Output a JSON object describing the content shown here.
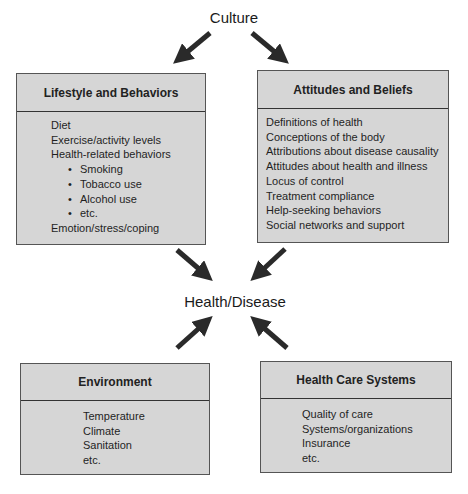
{
  "diagram": {
    "top_node": "Culture",
    "center_node": "Health/Disease",
    "boxes": {
      "lifestyle": {
        "title": "Lifestyle and Behaviors",
        "items": [
          {
            "text": "Diet",
            "bullet": false
          },
          {
            "text": "Exercise/activity levels",
            "bullet": false
          },
          {
            "text": "Health-related behaviors",
            "bullet": false
          },
          {
            "text": "Smoking",
            "bullet": true
          },
          {
            "text": "Tobacco use",
            "bullet": true
          },
          {
            "text": "Alcohol use",
            "bullet": true
          },
          {
            "text": "etc.",
            "bullet": true
          },
          {
            "text": "Emotion/stress/coping",
            "bullet": false
          }
        ]
      },
      "attitudes": {
        "title": "Attitudes and Beliefs",
        "items": [
          "Definitions of health",
          "Conceptions of the body",
          "Attributions about disease causality",
          "Attitudes about health and illness",
          "Locus of control",
          "Treatment compliance",
          "Help-seeking behaviors",
          "Social networks and support"
        ]
      },
      "environment": {
        "title": "Environment",
        "items": [
          "Temperature",
          "Climate",
          "Sanitation",
          "etc."
        ]
      },
      "healthcare": {
        "title": "Health Care Systems",
        "items": [
          "Quality of care",
          "Systems/organizations",
          "Insurance",
          "etc."
        ]
      }
    },
    "arrows": [
      {
        "from": "Culture",
        "to": "Lifestyle and Behaviors"
      },
      {
        "from": "Culture",
        "to": "Attitudes and Beliefs"
      },
      {
        "from": "Lifestyle and Behaviors",
        "to": "Health/Disease"
      },
      {
        "from": "Attitudes and Beliefs",
        "to": "Health/Disease"
      },
      {
        "from": "Environment",
        "to": "Health/Disease"
      },
      {
        "from": "Health Care Systems",
        "to": "Health/Disease"
      }
    ],
    "colors": {
      "box_fill": "#d6d6d6",
      "border": "#555555",
      "arrow": "#2a2a2a"
    }
  }
}
